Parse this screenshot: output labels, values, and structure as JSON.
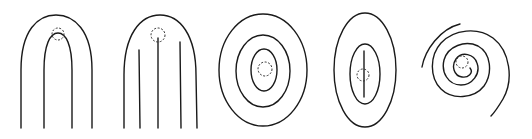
{
  "figure": {
    "panels": [
      {
        "id": 1,
        "pattern": "loop",
        "shape": "nested arches (two inverted U curves)",
        "marker": "dashed circle at apex of inner arch"
      },
      {
        "id": 2,
        "pattern": "arch-with-rods",
        "shape": "outer arch with three vertical lines inside",
        "marker": "dashed circle at top of center line"
      },
      {
        "id": 3,
        "pattern": "concentric-ellipses",
        "shape": "three concentric ellipses",
        "marker": "dashed circle at center"
      },
      {
        "id": 4,
        "pattern": "elongated-ellipses",
        "shape": "two concentric ellipses with central vertical line",
        "marker": "dashed circle on center line"
      },
      {
        "id": 5,
        "pattern": "spiral",
        "shape": "rounded-square spiral",
        "marker": "dashed circle at spiral origin"
      }
    ],
    "colors": {
      "stroke": "#1a1a1a",
      "background": "#ffffff"
    }
  }
}
